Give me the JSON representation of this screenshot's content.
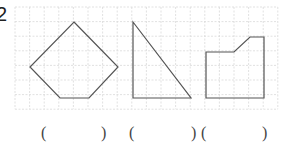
{
  "question": {
    "number": "2"
  },
  "grid": {
    "x0": 15,
    "y0": 7,
    "cell": 14.6,
    "cols": 18,
    "rows": 7,
    "line_color": "#d9d9d9"
  },
  "shapes": [
    {
      "name": "pentagon",
      "points": "74,22 118,67 89,98 60,98 30,67",
      "stroke": "#555555"
    },
    {
      "name": "right-triangle",
      "points": "133,22 191,98 133,98",
      "stroke": "#555555"
    },
    {
      "name": "notched-pentagon",
      "points": "206,52 234,52 250,37 264,37 264,98 206,98",
      "stroke": "#555555"
    }
  ],
  "answers": [
    {
      "open": "(",
      "close": ")",
      "open_x": 41,
      "close_x": 101
    },
    {
      "open": "(",
      "close": ")",
      "open_x": 129,
      "close_x": 191
    },
    {
      "open": "(",
      "close": ")",
      "open_x": 201,
      "close_x": 262
    }
  ]
}
